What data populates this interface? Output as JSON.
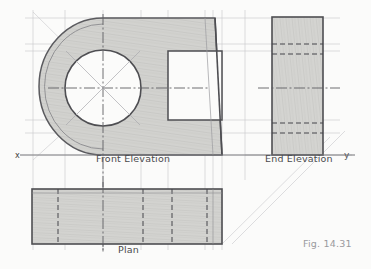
{
  "figure": {
    "caption": "Fig. 14.31",
    "paper_color": "#fbfbfa",
    "pencil_color": "#55555a",
    "shading_color": "#c9c9c6",
    "construction_color": "#c4c4c8"
  },
  "axis": {
    "x_marker": "x",
    "y_marker": "y",
    "baseline_y": 155
  },
  "views": [
    {
      "id": "front-elevation",
      "label": "Front Elevation",
      "label_x": 96,
      "label_y": 153,
      "description": "Shaded body with rounded (bullnose) left end, large circular bore with centre lines and diagonal construction square, rectangular unshaded opening at right, tapered right-hand edge",
      "bounds": {
        "x": 30,
        "y": 18,
        "width": 192,
        "height": 137
      },
      "circle": {
        "cx": 103,
        "cy": 88,
        "r": 38
      },
      "outer_arc_r": 62,
      "opening": {
        "x": 168,
        "y": 51,
        "width": 54,
        "height": 69
      }
    },
    {
      "id": "end-elevation",
      "label": "End Elevation",
      "label_x": 265,
      "label_y": 153,
      "description": "Shaded vertical rectangle with four horizontal hidden (dashed) lines and a horizontal centre line",
      "bounds": {
        "x": 272,
        "y": 17,
        "width": 51,
        "height": 138
      },
      "hidden_lines_y": [
        44,
        54,
        123,
        133
      ],
      "centre_line_y": 88
    },
    {
      "id": "plan",
      "label": "Plan",
      "label_x": 118,
      "label_y": 244,
      "description": "Shaded horizontal rectangle with vertical hidden (dashed) lines and a vertical centre line",
      "bounds": {
        "x": 32,
        "y": 189,
        "width": 190,
        "height": 55
      },
      "hidden_lines_x": [
        58,
        143,
        172,
        207
      ],
      "centre_line_x": 103
    }
  ],
  "annotations": {
    "mitre_lines": "two faint 45 degree projection lines from plan right edge to end elevation",
    "projector_lines": "thin horizontal and vertical projection lines linking the three views"
  }
}
